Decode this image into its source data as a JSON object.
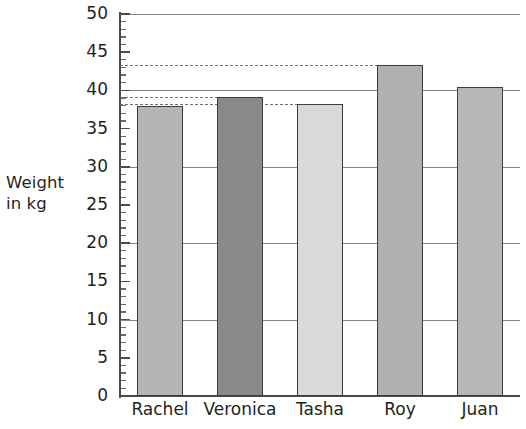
{
  "chart_data": {
    "type": "bar",
    "title": "",
    "xlabel": "",
    "ylabel": "Weight in kg",
    "ylabel_lines": [
      "Weight",
      "in kg"
    ],
    "categories": [
      "Rachel",
      "Veronica",
      "Tasha",
      "Roy",
      "Juan"
    ],
    "values": [
      38.0,
      39.2,
      38.2,
      43.3,
      40.4
    ],
    "series": [
      {
        "name": "Weight",
        "values": [
          38.0,
          39.2,
          38.2,
          43.3,
          40.4
        ]
      }
    ],
    "bar_colors": [
      "#b5b5b5",
      "#8a8a8a",
      "#d9d9d9",
      "#b0b0b0",
      "#b7b7b7"
    ],
    "bar_border_color": "#3d3d3d",
    "ylim": [
      0,
      50
    ],
    "ytick_step": 5,
    "yticks": [
      0,
      5,
      10,
      15,
      20,
      25,
      30,
      35,
      40,
      45,
      50
    ],
    "ytick_labels": [
      "0",
      "5",
      "10",
      "15",
      "20",
      "25",
      "30",
      "35",
      "40",
      "45",
      "50"
    ],
    "minor_tick_step": 1,
    "gridlines": [
      10,
      20,
      30,
      40,
      50
    ],
    "grid": true,
    "grid_color": "#6f6f6f",
    "legend": "none",
    "annotations": [
      {
        "name": "dashed-guide-roy",
        "value": 43.3,
        "from_category": "axis",
        "to_category": "Roy",
        "style": "dashed"
      },
      {
        "name": "dashed-guide-veronica",
        "value": 39.2,
        "from_category": "axis",
        "to_category": "Veronica",
        "style": "dashed"
      },
      {
        "name": "dashed-guide-tasha",
        "value": 38.2,
        "from_category": "axis",
        "to_category": "Tasha",
        "style": "dashed"
      }
    ],
    "axis_color": "#4a4a4a",
    "background": "#ffffff"
  }
}
